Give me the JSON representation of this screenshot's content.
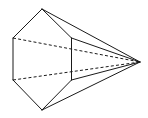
{
  "figure": {
    "line_color": "#1a1a1a",
    "background_color": "#ffffff",
    "vertices": {
      "base_top": "A",
      "base_upper_left": "B",
      "base_lower_left": "C",
      "base_bottom": "D",
      "base_lower_right": "E",
      "base_upper_right": "F",
      "apex": "P"
    },
    "edges": {
      "visible": [
        [
          "A",
          "B"
        ],
        [
          "B",
          "C"
        ],
        [
          "C",
          "D"
        ],
        [
          "D",
          "E"
        ],
        [
          "E",
          "F"
        ],
        [
          "F",
          "A"
        ],
        [
          "A",
          "P"
        ],
        [
          "F",
          "P"
        ],
        [
          "E",
          "P"
        ],
        [
          "D",
          "P"
        ]
      ],
      "hidden": [
        [
          "B",
          "P"
        ],
        [
          "C",
          "P"
        ]
      ]
    }
  }
}
